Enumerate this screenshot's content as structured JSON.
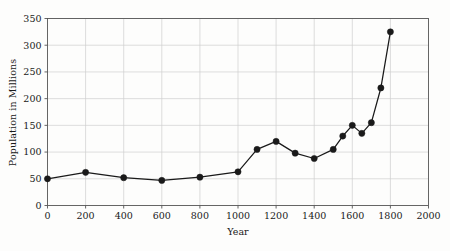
{
  "chart_data": {
    "type": "line",
    "title": "",
    "xlabel": "Year",
    "ylabel": "Population in Millions",
    "xlim": [
      0,
      2000
    ],
    "ylim": [
      0,
      350
    ],
    "grid": true,
    "legend": "none",
    "marker": "filled-circle",
    "line_color": "#1a1a1a",
    "marker_color": "#1a1a1a",
    "grid_color": "#cfcfcf",
    "axis_color": "#555555",
    "background_color": "#fdfdfc",
    "xticks": [
      0,
      200,
      400,
      600,
      800,
      1000,
      1200,
      1400,
      1600,
      1800,
      2000
    ],
    "xtick_labels": [
      "0",
      "200",
      "400",
      "600",
      "800",
      "1000",
      "1200",
      "1400",
      "1600",
      "1800",
      "2000"
    ],
    "yticks": [
      0,
      50,
      100,
      150,
      200,
      250,
      300,
      350
    ],
    "ytick_labels": [
      "0",
      "50",
      "100",
      "150",
      "200",
      "250",
      "300",
      "350"
    ],
    "x": [
      0,
      200,
      400,
      600,
      800,
      1000,
      1100,
      1200,
      1300,
      1400,
      1500,
      1550,
      1600,
      1650,
      1700,
      1750,
      1800
    ],
    "y": [
      50,
      62,
      52,
      47,
      53,
      63,
      105,
      120,
      98,
      88,
      105,
      130,
      150,
      135,
      155,
      220,
      325
    ],
    "series": [
      {
        "name": "Population",
        "values": [
          50,
          62,
          52,
          47,
          53,
          63,
          105,
          120,
          98,
          88,
          105,
          130,
          150,
          135,
          155,
          220,
          325
        ]
      }
    ]
  }
}
